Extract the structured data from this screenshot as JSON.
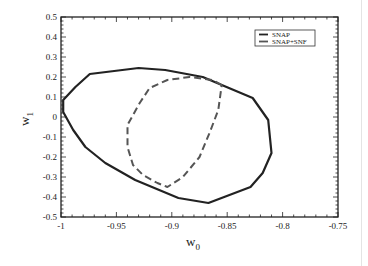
{
  "chart_data": {
    "type": "line",
    "title": "",
    "xlabel": "w",
    "xlabel_sub": "0",
    "ylabel": "w",
    "ylabel_sub": "1",
    "xlim": [
      -1,
      -0.75
    ],
    "ylim": [
      -0.5,
      0.5
    ],
    "xticks": [
      -1,
      -0.95,
      -0.9,
      -0.85,
      -0.8,
      -0.75
    ],
    "xtick_labels": [
      "-1",
      "-0.95",
      "-0.9",
      "-0.85",
      "-0.8",
      "-0.75"
    ],
    "yticks": [
      -0.5,
      -0.4,
      -0.3,
      -0.2,
      -0.1,
      0,
      0.1,
      0.2,
      0.3,
      0.4,
      0.5
    ],
    "ytick_labels": [
      "-0.5",
      "-0.4",
      "-0.3",
      "-0.2",
      "-0.1",
      "0",
      "0.1",
      "0.2",
      "0.3",
      "0.4",
      "0.5"
    ],
    "grid": false,
    "legend_position": "top-right",
    "series": [
      {
        "name": "SNAP",
        "style": "solid",
        "closed": true,
        "color": "#222222",
        "points": [
          [
            -0.998,
            0.085
          ],
          [
            -0.987,
            0.15
          ],
          [
            -0.974,
            0.215
          ],
          [
            -0.93,
            0.245
          ],
          [
            -0.906,
            0.235
          ],
          [
            -0.872,
            0.2
          ],
          [
            -0.827,
            0.095
          ],
          [
            -0.813,
            -0.015
          ],
          [
            -0.81,
            -0.18
          ],
          [
            -0.818,
            -0.28
          ],
          [
            -0.829,
            -0.35
          ],
          [
            -0.867,
            -0.43
          ],
          [
            -0.894,
            -0.405
          ],
          [
            -0.933,
            -0.315
          ],
          [
            -0.96,
            -0.23
          ],
          [
            -0.978,
            -0.15
          ],
          [
            -0.989,
            -0.065
          ],
          [
            -0.998,
            0.025
          ]
        ]
      },
      {
        "name": "SNAP+SNF",
        "style": "dashed",
        "closed": true,
        "color": "#555555",
        "points": [
          [
            -0.855,
            0.16
          ],
          [
            -0.863,
            0.185
          ],
          [
            -0.884,
            0.2
          ],
          [
            -0.904,
            0.185
          ],
          [
            -0.92,
            0.145
          ],
          [
            -0.929,
            0.07
          ],
          [
            -0.94,
            -0.04
          ],
          [
            -0.94,
            -0.15
          ],
          [
            -0.935,
            -0.24
          ],
          [
            -0.926,
            -0.29
          ],
          [
            -0.913,
            -0.33
          ],
          [
            -0.904,
            -0.35
          ],
          [
            -0.89,
            -0.3
          ],
          [
            -0.875,
            -0.2
          ],
          [
            -0.866,
            -0.08
          ],
          [
            -0.858,
            0.035
          ]
        ]
      }
    ]
  }
}
